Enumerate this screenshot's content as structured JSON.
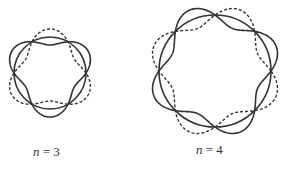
{
  "figures": [
    {
      "id": "n3",
      "n": 3,
      "label_var": "n",
      "label_eq": " = 3",
      "cx": 50,
      "cy": 73,
      "R": 36,
      "A": 8,
      "label_x": 33,
      "label_y": 144
    },
    {
      "id": "n4",
      "n": 4,
      "label_var": "n",
      "label_eq": " = 4",
      "cx": 215,
      "cy": 71,
      "R": 56,
      "A": 10,
      "label_x": 196,
      "label_y": 142
    }
  ],
  "colors": {
    "stroke": "#333333",
    "background": "#ffffff"
  }
}
